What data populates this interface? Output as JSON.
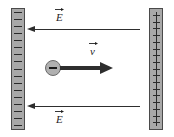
{
  "figure": {
    "name": "parallel-plate-capacitor-with-moving-negative-charge",
    "background_color": "#ffffff"
  },
  "plates": {
    "negative": {
      "label": "negative-plate",
      "sign": "−",
      "sign_count": 17,
      "fill_color": "#a8a8a8",
      "border_color": "#4a4a4a"
    },
    "positive": {
      "label": "positive-plate",
      "sign": "+",
      "sign_count": 17,
      "fill_color": "#a8a8a8",
      "border_color": "#4a4a4a"
    }
  },
  "vectors": {
    "field_top": {
      "label": "E",
      "symbol": "E",
      "direction": "left",
      "color": "#2e2e2e"
    },
    "field_bottom": {
      "label": "E",
      "symbol": "E",
      "direction": "left",
      "color": "#2e2e2e"
    },
    "velocity": {
      "label": "v",
      "symbol": "v",
      "direction": "right",
      "color": "#2e2e2e"
    }
  },
  "charge": {
    "label": "negative-point-charge",
    "sign": "−",
    "fill_color": "#b0b0b0",
    "border_color": "#6a6a6a"
  }
}
